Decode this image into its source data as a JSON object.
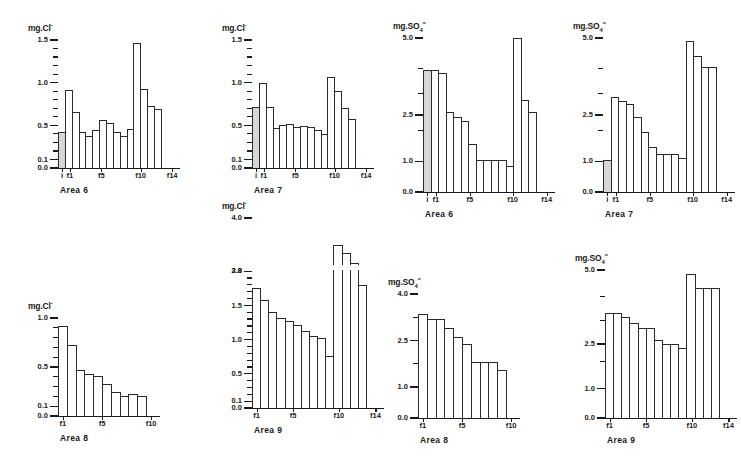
{
  "figure": {
    "panel_count": 8
  },
  "chart_data": [
    {
      "id": "area6-cl",
      "type": "bar",
      "title": "Area 6",
      "ylabel": "mg.Cl⁻",
      "ylabel_parts": {
        "prefix": "mg.Cl",
        "sup": "-"
      },
      "xlabel": "",
      "ylim": [
        0.0,
        1.5
      ],
      "grid": false,
      "legend": "none",
      "ytick_labels": [
        "1.5",
        "1.0",
        "0.5",
        "0.1",
        "0.0"
      ],
      "ytick_values": [
        1.5,
        1.0,
        0.5,
        0.1,
        0.0
      ],
      "yminor_values": [
        1.4,
        1.3,
        1.2,
        1.1,
        0.9,
        0.8,
        0.7,
        0.6,
        0.4,
        0.3,
        0.2
      ],
      "categories": [
        "i",
        "f1",
        "f2",
        "f3",
        "f4",
        "f5",
        "f6",
        "f7",
        "f8",
        "f9",
        "f10",
        "f11",
        "f12",
        "f13",
        "f14"
      ],
      "xtick_labels": [
        "i",
        "f1",
        "f5",
        "f10",
        "f14"
      ],
      "xtick_indices": [
        0,
        1,
        5,
        10,
        14
      ],
      "values": [
        0.42,
        0.92,
        0.66,
        0.42,
        0.37,
        0.44,
        0.56,
        0.53,
        0.42,
        0.37,
        0.46,
        1.47,
        0.93,
        0.73,
        0.69
      ],
      "shaded_indices": [
        0
      ],
      "axis_break": null
    },
    {
      "id": "area7-cl",
      "type": "bar",
      "title": "Area 7",
      "ylabel": "mg.Cl⁻",
      "ylabel_parts": {
        "prefix": "mg.Cl",
        "sup": "-"
      },
      "xlabel": "",
      "ylim": [
        0.0,
        1.5
      ],
      "grid": false,
      "legend": "none",
      "ytick_labels": [
        "1.5",
        "1.0",
        "0.5",
        "0.1",
        "0.0"
      ],
      "ytick_values": [
        1.5,
        1.0,
        0.5,
        0.1,
        0.0
      ],
      "yminor_values": [
        1.4,
        1.3,
        1.2,
        1.1,
        0.9,
        0.8,
        0.7,
        0.6,
        0.4,
        0.3,
        0.2
      ],
      "categories": [
        "i",
        "f1",
        "f2",
        "f3",
        "f4",
        "f5",
        "f6",
        "f7",
        "f8",
        "f9",
        "f10",
        "f11",
        "f12",
        "f13",
        "f14"
      ],
      "xtick_labels": [
        "i",
        "f1",
        "f5",
        "f10",
        "f14"
      ],
      "xtick_indices": [
        0,
        1,
        5,
        10,
        14
      ],
      "values": [
        0.72,
        1.0,
        0.72,
        0.47,
        0.5,
        0.52,
        0.48,
        0.49,
        0.48,
        0.44,
        0.4,
        1.07,
        0.9,
        0.7,
        0.58
      ],
      "shaded_indices": [
        0
      ],
      "axis_break": null
    },
    {
      "id": "area6-so4",
      "type": "bar",
      "title": "Area 6",
      "ylabel": "mg.SO₄⁼",
      "ylabel_parts": {
        "prefix": "mg.SO",
        "sub": "4",
        "sup": "="
      },
      "xlabel": "",
      "ylim": [
        0.0,
        5.0
      ],
      "grid": false,
      "legend": "none",
      "ytick_labels": [
        "5.0",
        "2.5",
        "1.0",
        "0.0"
      ],
      "ytick_values": [
        5.0,
        2.5,
        1.0,
        0.0
      ],
      "yminor_values": [
        4.0,
        3.2,
        2.0
      ],
      "categories": [
        "i",
        "f1",
        "f2",
        "f3",
        "f4",
        "f5",
        "f6",
        "f7",
        "f8",
        "f9",
        "f10",
        "f11",
        "f12",
        "f13",
        "f14"
      ],
      "xtick_labels": [
        "i",
        "f1",
        "f5",
        "f10",
        "f14"
      ],
      "xtick_indices": [
        0,
        1,
        5,
        10,
        14
      ],
      "values": [
        3.95,
        3.95,
        3.85,
        2.6,
        2.45,
        2.3,
        1.55,
        1.05,
        1.05,
        1.05,
        1.05,
        0.85,
        5.0,
        3.0,
        2.6,
        1.4
      ],
      "shaded_indices": [
        0
      ],
      "axis_break": null
    },
    {
      "id": "area7-so4",
      "type": "bar",
      "title": "Area 7",
      "ylabel": "mg.SO₄⁼",
      "ylabel_parts": {
        "prefix": "mg.SO",
        "sub": "4",
        "sup": "="
      },
      "xlabel": "",
      "ylim": [
        0.0,
        5.0
      ],
      "grid": false,
      "legend": "none",
      "ytick_labels": [
        "5.0",
        "2.5",
        "1.0",
        "0.0"
      ],
      "ytick_values": [
        5.0,
        2.5,
        1.0,
        0.0
      ],
      "yminor_values": [
        4.0,
        3.2,
        2.0
      ],
      "categories": [
        "i",
        "f1",
        "f2",
        "f3",
        "f4",
        "f5",
        "f6",
        "f7",
        "f8",
        "f9",
        "f10",
        "f11",
        "f12",
        "f13",
        "f14"
      ],
      "xtick_labels": [
        "i",
        "f1",
        "f5",
        "f10",
        "f14"
      ],
      "xtick_indices": [
        0,
        1,
        5,
        10,
        14
      ],
      "values": [
        1.05,
        3.1,
        2.95,
        2.85,
        2.45,
        1.95,
        1.45,
        1.25,
        1.25,
        1.25,
        1.1,
        4.9,
        4.4,
        4.05,
        4.05
      ],
      "shaded_indices": [
        0
      ],
      "axis_break": null
    },
    {
      "id": "area8-cl",
      "type": "bar",
      "title": "Area 8",
      "ylabel": "mg.Cl⁻",
      "ylabel_parts": {
        "prefix": "mg.Cl",
        "sup": "-"
      },
      "xlabel": "",
      "ylim": [
        0.0,
        1.0
      ],
      "grid": false,
      "legend": "none",
      "ytick_labels": [
        "1.0",
        "0.5",
        "0.1",
        "0.0"
      ],
      "ytick_values": [
        1.0,
        0.5,
        0.1,
        0.0
      ],
      "yminor_values": [
        0.9,
        0.8,
        0.7,
        0.6,
        0.4,
        0.3,
        0.2
      ],
      "categories": [
        "f1",
        "f2",
        "f3",
        "f4",
        "f5",
        "f6",
        "f7",
        "f8",
        "f9",
        "f10"
      ],
      "xtick_labels": [
        "f1",
        "f5",
        "f10"
      ],
      "xtick_indices": [
        0,
        4,
        9
      ],
      "values": [
        0.92,
        0.72,
        0.47,
        0.43,
        0.41,
        0.33,
        0.24,
        0.2,
        0.22,
        0.2
      ],
      "shaded_indices": [],
      "axis_break": null
    },
    {
      "id": "area9-cl",
      "type": "bar",
      "title": "Area 9",
      "ylabel": "mg.Cl⁻",
      "ylabel_parts": {
        "prefix": "mg.Cl",
        "sup": "-"
      },
      "xlabel": "",
      "ylim": [
        0.0,
        4.0
      ],
      "grid": false,
      "legend": "none",
      "ytick_labels": [
        "4.0",
        "3.8",
        "2.0",
        "1.5",
        "1.0",
        "0.5",
        "0.1",
        "0.0"
      ],
      "ytick_values": [
        4.0,
        3.8,
        2.0,
        1.5,
        1.0,
        0.5,
        0.1,
        0.0
      ],
      "yminor_values": [
        1.9,
        1.8,
        1.7,
        1.6,
        1.4,
        1.3,
        1.2,
        1.1,
        0.9,
        0.8,
        0.7,
        0.6,
        0.4,
        0.3,
        0.2
      ],
      "categories": [
        "f1",
        "f2",
        "f3",
        "f4",
        "f5",
        "f6",
        "f7",
        "f8",
        "f9",
        "f10",
        "f11",
        "f12",
        "f13",
        "f14"
      ],
      "xtick_labels": [
        "f1",
        "f5",
        "f10",
        "f14"
      ],
      "xtick_indices": [
        0,
        4,
        9,
        13
      ],
      "values": [
        1.75,
        1.58,
        1.4,
        1.32,
        1.27,
        1.22,
        1.12,
        1.05,
        1.02,
        0.76,
        3.9,
        3.87,
        3.83,
        3.75
      ],
      "shaded_indices": [],
      "axis_break": {
        "from": 2.0,
        "to": 3.8
      }
    },
    {
      "id": "area8-so4",
      "type": "bar",
      "title": "Area 8",
      "ylabel": "mg.SO₄⁼",
      "ylabel_parts": {
        "prefix": "mg.SO",
        "sub": "4",
        "sup": "="
      },
      "xlabel": "",
      "ylim": [
        0.0,
        4.0
      ],
      "grid": false,
      "legend": "none",
      "ytick_labels": [
        "4.0",
        "2.5",
        "1.0",
        "0.0"
      ],
      "ytick_values": [
        4.0,
        2.5,
        1.0,
        0.0
      ],
      "yminor_values": [
        3.25,
        1.75
      ],
      "categories": [
        "f1",
        "f2",
        "f3",
        "f4",
        "f5",
        "f6",
        "f7",
        "f8",
        "f9",
        "f10"
      ],
      "xtick_labels": [
        "f1",
        "f5",
        "f10"
      ],
      "xtick_indices": [
        0,
        4,
        9
      ],
      "values": [
        3.35,
        3.2,
        3.2,
        2.9,
        2.6,
        2.4,
        1.8,
        1.8,
        1.8,
        1.55
      ],
      "shaded_indices": [],
      "axis_break": null
    },
    {
      "id": "area9-so4",
      "type": "bar",
      "title": "Area 9",
      "ylabel": "mg.SO₄⁼",
      "ylabel_parts": {
        "prefix": "mg.SO",
        "sub": "4",
        "sup": "="
      },
      "xlabel": "",
      "ylim": [
        0.0,
        5.0
      ],
      "grid": false,
      "legend": "none",
      "ytick_labels": [
        "5.0",
        "2.5",
        "1.0",
        "0.0"
      ],
      "ytick_values": [
        5.0,
        2.5,
        1.0,
        0.0
      ],
      "yminor_values": [
        4.1,
        3.3,
        1.9
      ],
      "categories": [
        "f1",
        "f2",
        "f3",
        "f4",
        "f5",
        "f6",
        "f7",
        "f8",
        "f9",
        "f10",
        "f11",
        "f12",
        "f13",
        "f14"
      ],
      "xtick_labels": [
        "f1",
        "f5",
        "f10",
        "f14"
      ],
      "xtick_indices": [
        0,
        4,
        9,
        13
      ],
      "values": [
        3.55,
        3.55,
        3.4,
        3.2,
        3.05,
        3.05,
        2.65,
        2.5,
        2.5,
        2.35,
        4.85,
        4.4,
        4.4,
        4.4
      ],
      "shaded_indices": [],
      "axis_break": null
    }
  ],
  "layout": {
    "panels": [
      {
        "id": "area6-cl",
        "left": 18,
        "top": 18,
        "plot_left": 40,
        "plot_top": 22,
        "plot_w": 118,
        "plot_h": 128
      },
      {
        "id": "area7-cl",
        "left": 212,
        "top": 18,
        "plot_left": 40,
        "plot_top": 22,
        "plot_w": 118,
        "plot_h": 128
      },
      {
        "id": "area6-so4",
        "left": 385,
        "top": 14,
        "plot_left": 38,
        "plot_top": 24,
        "plot_w": 128,
        "plot_h": 154
      },
      {
        "id": "area7-so4",
        "left": 565,
        "top": 14,
        "plot_left": 38,
        "plot_top": 24,
        "plot_w": 128,
        "plot_h": 154
      },
      {
        "id": "area8-cl",
        "left": 18,
        "top": 298,
        "plot_left": 40,
        "plot_top": 20,
        "plot_w": 98,
        "plot_h": 98
      },
      {
        "id": "area9-cl",
        "left": 212,
        "top": 196,
        "plot_left": 40,
        "plot_top": 22,
        "plot_w": 128,
        "plot_h": 190
      },
      {
        "id": "area8-so4",
        "left": 378,
        "top": 272,
        "plot_left": 40,
        "plot_top": 22,
        "plot_w": 98,
        "plot_h": 124
      },
      {
        "id": "area9-so4",
        "left": 565,
        "top": 248,
        "plot_left": 40,
        "plot_top": 22,
        "plot_w": 128,
        "plot_h": 148
      }
    ]
  }
}
